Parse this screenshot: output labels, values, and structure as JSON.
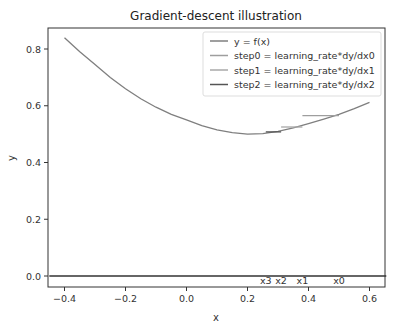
{
  "chart_data": {
    "type": "line",
    "title": "Gradient-descent illustration",
    "xlabel": "x",
    "ylabel": "y",
    "xlim": [
      -0.45,
      0.655
    ],
    "ylim": [
      -0.04,
      0.88
    ],
    "xticks": [
      -0.4,
      -0.2,
      0.0,
      0.2,
      0.4,
      0.6
    ],
    "xtick_labels": [
      "−0.4",
      "−0.2",
      "0.0",
      "0.2",
      "0.4",
      "0.6"
    ],
    "yticks": [
      0.0,
      0.2,
      0.4,
      0.6,
      0.8
    ],
    "ytick_labels": [
      "0.0",
      "0.2",
      "0.4",
      "0.6",
      "0.8"
    ],
    "grid": false,
    "legend_position": "upper right",
    "series": [
      {
        "name": "y = f(x)",
        "color": "#7f7f7f",
        "x": [
          -0.4,
          -0.35,
          -0.3,
          -0.25,
          -0.2,
          -0.15,
          -0.1,
          -0.05,
          0.0,
          0.05,
          0.1,
          0.15,
          0.2,
          0.25,
          0.3,
          0.35,
          0.4,
          0.45,
          0.5,
          0.55,
          0.6
        ],
        "y": [
          0.84,
          0.79,
          0.745,
          0.7,
          0.66,
          0.625,
          0.595,
          0.57,
          0.55,
          0.53,
          0.515,
          0.505,
          0.5,
          0.502,
          0.51,
          0.522,
          0.537,
          0.553,
          0.57,
          0.59,
          0.612
        ]
      },
      {
        "name": "step0 = learning_rate*dy/dx0",
        "color": "#9e9e9e",
        "x": [
          0.38,
          0.5
        ],
        "y": [
          0.565,
          0.565
        ]
      },
      {
        "name": "step1 = learning_rate*dy/dx1",
        "color": "#a8a8a8",
        "x": [
          0.31,
          0.38
        ],
        "y": [
          0.525,
          0.525
        ]
      },
      {
        "name": "step2 = learning_rate*dy/dx2",
        "color": "#555555",
        "x": [
          0.26,
          0.31
        ],
        "y": [
          0.508,
          0.508
        ]
      },
      {
        "name": "baseline y=0",
        "color": "#333333",
        "x": [
          -0.45,
          0.655
        ],
        "y": [
          0.0,
          0.0
        ]
      }
    ],
    "annotations": [
      {
        "text": "x3",
        "x": 0.26,
        "y": -0.015
      },
      {
        "text": "x2",
        "x": 0.31,
        "y": -0.015
      },
      {
        "text": "x1",
        "x": 0.38,
        "y": -0.015
      },
      {
        "text": "x0",
        "x": 0.5,
        "y": -0.015
      }
    ]
  }
}
